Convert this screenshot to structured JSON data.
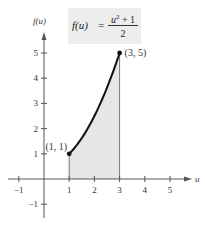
{
  "chart_data": {
    "type": "area",
    "title": "",
    "function_label": "f(u) = (u^2 + 1) / 2",
    "formula": {
      "lhs": "f(u)",
      "eq": "=",
      "numerator_base": "u",
      "numerator_exp": "2",
      "numerator_rest": " + 1",
      "denominator": "2"
    },
    "xlabel": "u",
    "ylabel": "f(u)",
    "xlim": [
      -1.2,
      5.6
    ],
    "ylim": [
      -1.4,
      5.6
    ],
    "x_ticks": [
      -1,
      1,
      2,
      3,
      4,
      5
    ],
    "y_ticks": [
      -1,
      1,
      2,
      3,
      4,
      5
    ],
    "x_tick_labels": [
      "−1",
      "1",
      "2",
      "3",
      "4",
      "5"
    ],
    "y_tick_labels": [
      "−1",
      "1",
      "2",
      "3",
      "4",
      "5"
    ],
    "curve": {
      "x": [
        1,
        1.5,
        2,
        2.5,
        3
      ],
      "y": [
        1,
        1.625,
        2.5,
        3.625,
        5
      ]
    },
    "shaded_region": {
      "from_x": 1,
      "to_x": 3,
      "color": "#e6e6e6"
    },
    "points": [
      {
        "x": 1,
        "y": 1,
        "label": "(1, 1)"
      },
      {
        "x": 3,
        "y": 5,
        "label": "(3, 5)"
      }
    ],
    "grid": false,
    "legend": "none"
  },
  "colors": {
    "curve": "#111111",
    "axis": "#555555",
    "fill": "#e6e6e6",
    "formula_bg": "#ededed"
  }
}
